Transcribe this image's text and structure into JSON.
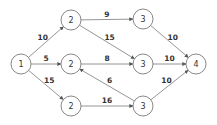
{
  "diagram": {
    "type": "directed-network",
    "nodes": [
      {
        "id": "n1",
        "label": "1",
        "x": 21,
        "y": 64
      },
      {
        "id": "n2a",
        "label": "2",
        "x": 71,
        "y": 20
      },
      {
        "id": "n2b",
        "label": "2",
        "x": 71,
        "y": 64
      },
      {
        "id": "n2c",
        "label": "2",
        "x": 71,
        "y": 106
      },
      {
        "id": "n3a",
        "label": "3",
        "x": 143,
        "y": 19
      },
      {
        "id": "n3b",
        "label": "3",
        "x": 143,
        "y": 64
      },
      {
        "id": "n3c",
        "label": "3",
        "x": 143,
        "y": 106
      },
      {
        "id": "n4",
        "label": "4",
        "x": 196,
        "y": 64
      }
    ],
    "edges": [
      {
        "from": "n1",
        "to": "n2a",
        "weight": "10"
      },
      {
        "from": "n1",
        "to": "n2b",
        "weight": "5"
      },
      {
        "from": "n1",
        "to": "n2c",
        "weight": "15"
      },
      {
        "from": "n2a",
        "to": "n3a",
        "weight": "9"
      },
      {
        "from": "n2a",
        "to": "n3b",
        "weight": "15"
      },
      {
        "from": "n2b",
        "to": "n3b",
        "weight": "8"
      },
      {
        "from": "n2c",
        "to": "n3c",
        "weight": "16"
      },
      {
        "from": "n3c",
        "to": "n2b",
        "weight": "6"
      },
      {
        "from": "n3a",
        "to": "n4",
        "weight": "10"
      },
      {
        "from": "n3b",
        "to": "n4",
        "weight": "10"
      },
      {
        "from": "n3c",
        "to": "n4",
        "weight": "10"
      }
    ]
  }
}
